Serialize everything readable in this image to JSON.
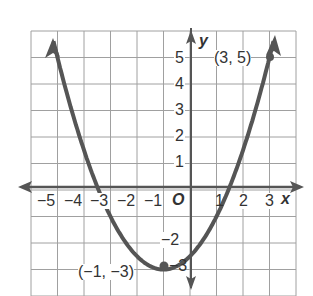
{
  "chart_data": {
    "type": "line",
    "title": "",
    "equation": "y = 0.5(x + 1)^2 - 3",
    "xlabel": "x",
    "ylabel": "y",
    "origin_label": "O",
    "xlim": [
      -6,
      4
    ],
    "ylim": [
      -4,
      6
    ],
    "grid": true,
    "x_ticks": [
      "-5",
      "-4",
      "-3",
      "-2",
      "-1",
      "1",
      "2",
      "3"
    ],
    "y_ticks": [
      "5",
      "4",
      "3",
      "2",
      "1",
      "-2",
      "-3"
    ],
    "series": [
      {
        "name": "parabola",
        "vertex": [
          -1,
          -3
        ],
        "points": [
          [
            -5.2,
            5.82
          ],
          [
            -5,
            5
          ],
          [
            -4,
            1.5
          ],
          [
            -3,
            -1
          ],
          [
            -2,
            -2.5
          ],
          [
            -1,
            -3
          ],
          [
            0,
            -2.5
          ],
          [
            1,
            -1
          ],
          [
            2,
            1.5
          ],
          [
            3,
            5
          ],
          [
            3.2,
            5.82
          ]
        ]
      }
    ],
    "annotations": [
      {
        "label": "(3, 5)",
        "x": 3,
        "y": 5
      },
      {
        "label": "(−1, −3)",
        "x": -1,
        "y": -3
      }
    ],
    "colors": {
      "curve": "#555555",
      "grid": "#9a9a9a",
      "axis": "#555555"
    }
  },
  "labels": {
    "x_axis": "x",
    "y_axis": "y",
    "origin": "O",
    "xt": [
      "−5",
      "−4",
      "−3",
      "−2",
      "−1",
      "1",
      "2",
      "3"
    ],
    "yt": [
      "5",
      "4",
      "3",
      "2",
      "1",
      "−2",
      "−3"
    ],
    "pt1": "(3, 5)",
    "pt2": "(−1, −3)"
  }
}
